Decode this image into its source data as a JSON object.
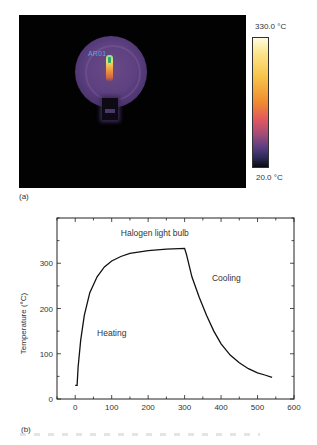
{
  "panel_a": {
    "label": "(a)",
    "roi_label": "AR01",
    "colorbar": {
      "max_label": "330.0 °C",
      "min_label": "20.0 °C",
      "colors": [
        "#fffbe0",
        "#f7c44a",
        "#f08a30",
        "#e2585e",
        "#a04c7a",
        "#5a3c82",
        "#0a0a14"
      ]
    }
  },
  "panel_b": {
    "label": "(b)"
  },
  "chart_data": {
    "type": "line",
    "title": "Halogen light bulb",
    "xlabel": "Time (s)",
    "ylabel": "Temperature (°C)",
    "xlim": [
      -50,
      600
    ],
    "ylim": [
      0,
      400
    ],
    "xticks": [
      0,
      100,
      200,
      300,
      400,
      500,
      600
    ],
    "yticks": [
      0,
      100,
      200,
      300
    ],
    "grid": false,
    "annotations": [
      {
        "text": "Heating",
        "x": 60,
        "y": 140
      },
      {
        "text": "Cooling",
        "x": 375,
        "y": 260
      },
      {
        "text": "Halogen light bulb",
        "x": 125,
        "y": 360
      }
    ],
    "series": [
      {
        "name": "Halogen light bulb",
        "x": [
          0,
          5,
          8,
          15,
          25,
          40,
          60,
          80,
          100,
          125,
          150,
          200,
          250,
          300,
          305,
          320,
          340,
          360,
          380,
          400,
          425,
          450,
          475,
          500,
          520,
          540
        ],
        "y": [
          30,
          30,
          70,
          130,
          185,
          235,
          270,
          292,
          305,
          315,
          322,
          328,
          331,
          333,
          320,
          270,
          225,
          185,
          150,
          122,
          97,
          80,
          67,
          58,
          53,
          48
        ]
      }
    ]
  }
}
